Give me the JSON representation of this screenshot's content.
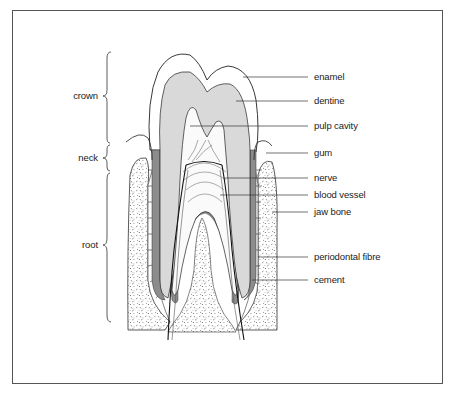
{
  "figure": {
    "regions": [
      {
        "label": "crown",
        "y": 96
      },
      {
        "label": "neck",
        "y": 158
      },
      {
        "label": "root",
        "y": 245
      }
    ],
    "parts": [
      {
        "label": "enamel",
        "y": 77
      },
      {
        "label": "dentine",
        "y": 101
      },
      {
        "label": "pulp cavity",
        "y": 127
      },
      {
        "label": "gum",
        "y": 153
      },
      {
        "label": "nerve",
        "y": 178
      },
      {
        "label": "blood vessel",
        "y": 196
      },
      {
        "label": "jaw bone",
        "y": 212
      },
      {
        "label": "periodontal fibre",
        "y": 257
      },
      {
        "label": "cement",
        "y": 280
      }
    ],
    "colors": {
      "dentine": "#d9d9d9",
      "cement": "#8c8c8c",
      "outline": "#222222",
      "frame": "#555555"
    }
  }
}
